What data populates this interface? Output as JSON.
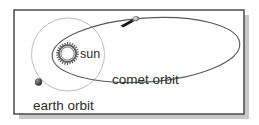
{
  "figure": {
    "background_color": "#ffffff",
    "frame": {
      "border_color": "#404040",
      "shadow_color": "#9a9a9a",
      "x": 14,
      "y": 10,
      "width": 230,
      "height": 104
    },
    "labels": {
      "sun": "sun",
      "comet_orbit": "comet orbit",
      "earth_orbit": "earth orbit"
    },
    "objects": {
      "sun": {
        "name": "sun",
        "cx": 67.5,
        "cy": 53.5,
        "outer_r": 11.5,
        "inner_r": 7.5,
        "spokes": 26,
        "color": "#585858"
      },
      "earth": {
        "name": "earth",
        "cx": 38.5,
        "cy": 82.0,
        "r": 3.6,
        "color": "#4a4a4a"
      },
      "comet": {
        "name": "comet",
        "head_x": 135.0,
        "head_y": 18.5,
        "tail_x": 120.0,
        "tail_y": 25.5,
        "color": "#1d1d1d"
      }
    },
    "orbits": {
      "earth_orbit": {
        "name": "earth orbit",
        "shape": "circle",
        "cx": 68.0,
        "cy": 54.5,
        "r": 36.5,
        "stroke": "#b9b9b9",
        "stroke_width": 1.0
      },
      "comet_orbit": {
        "name": "comet orbit",
        "shape": "ellipse",
        "cx": 146.0,
        "cy": 50.0,
        "rx": 94.0,
        "ry": 32.0,
        "rotation_deg": -4,
        "stroke": "#5a5a5a",
        "stroke_width": 1.1
      }
    },
    "label_positions": {
      "sun": {
        "x": 80,
        "y": 58,
        "font_size": 12
      },
      "comet_orbit": {
        "x": 112,
        "y": 84,
        "font_size": 13
      },
      "earth_orbit": {
        "x": 33,
        "y": 110,
        "font_size": 13
      }
    }
  }
}
